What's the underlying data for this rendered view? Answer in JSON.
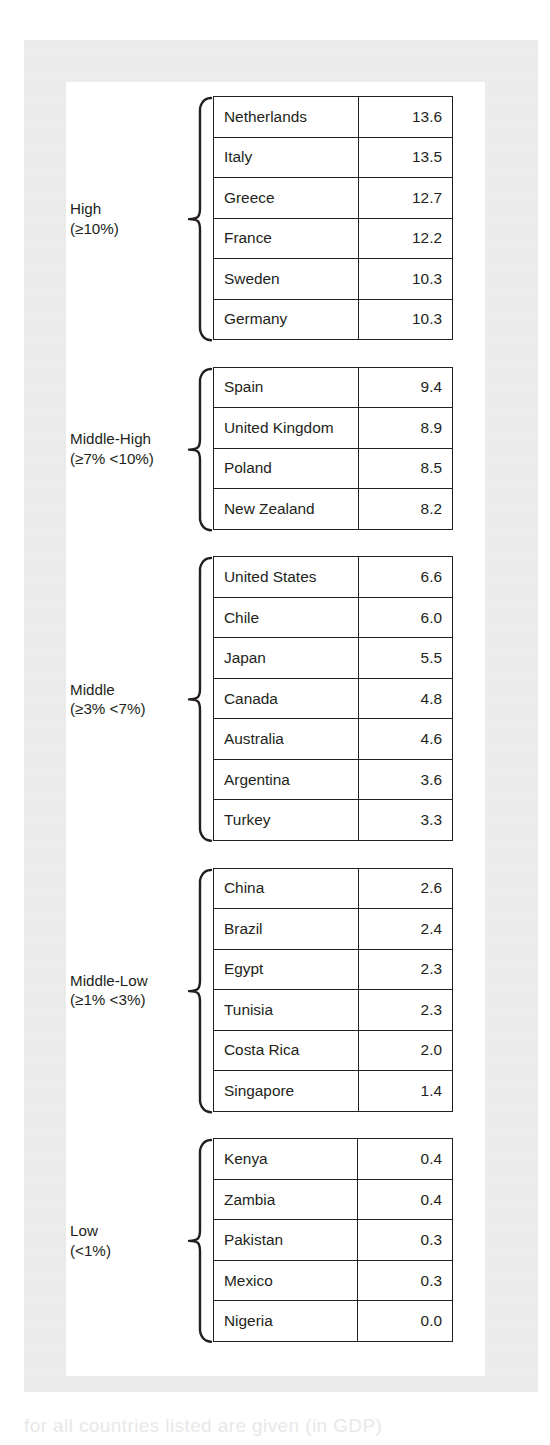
{
  "figure": {
    "caption_fragment": "for all countries listed are given (in GDP)",
    "table_columns": [
      "Country",
      "Percent"
    ]
  },
  "chart_data": {
    "type": "table",
    "title": "",
    "xlabel": "",
    "ylabel": "",
    "columns": [
      "Country",
      "Value (%)"
    ],
    "groups": [
      {
        "label": "High",
        "range": "(≥10%)",
        "rows": [
          {
            "country": "Netherlands",
            "value": "13.6"
          },
          {
            "country": "Italy",
            "value": "13.5"
          },
          {
            "country": "Greece",
            "value": "12.7"
          },
          {
            "country": "France",
            "value": "12.2"
          },
          {
            "country": "Sweden",
            "value": "10.3"
          },
          {
            "country": "Germany",
            "value": "10.3"
          }
        ]
      },
      {
        "label": "Middle-High",
        "range": "(≥7% <10%)",
        "rows": [
          {
            "country": "Spain",
            "value": "9.4"
          },
          {
            "country": "United Kingdom",
            "value": "8.9"
          },
          {
            "country": "Poland",
            "value": "8.5"
          },
          {
            "country": "New Zealand",
            "value": "8.2"
          }
        ]
      },
      {
        "label": "Middle",
        "range": "(≥3% <7%)",
        "rows": [
          {
            "country": "United States",
            "value": "6.6"
          },
          {
            "country": "Chile",
            "value": "6.0"
          },
          {
            "country": "Japan",
            "value": "5.5"
          },
          {
            "country": "Canada",
            "value": "4.8"
          },
          {
            "country": "Australia",
            "value": "4.6"
          },
          {
            "country": "Argentina",
            "value": "3.6"
          },
          {
            "country": "Turkey",
            "value": "3.3"
          }
        ]
      },
      {
        "label": "Middle-Low",
        "range": "(≥1% <3%)",
        "rows": [
          {
            "country": "China",
            "value": "2.6"
          },
          {
            "country": "Brazil",
            "value": "2.4"
          },
          {
            "country": "Egypt",
            "value": "2.3"
          },
          {
            "country": "Tunisia",
            "value": "2.3"
          },
          {
            "country": "Costa Rica",
            "value": "2.0"
          },
          {
            "country": "Singapore",
            "value": "1.4"
          }
        ]
      },
      {
        "label": "Low",
        "range": "(<1%)",
        "rows": [
          {
            "country": "Kenya",
            "value": "0.4"
          },
          {
            "country": "Zambia",
            "value": "0.4"
          },
          {
            "country": "Pakistan",
            "value": "0.3"
          },
          {
            "country": "Mexico",
            "value": "0.3"
          },
          {
            "country": "Nigeria",
            "value": "0.0"
          }
        ]
      }
    ]
  },
  "colors": {
    "ink": "#231f20",
    "card": "#ffffff",
    "paper": "#ededed"
  }
}
